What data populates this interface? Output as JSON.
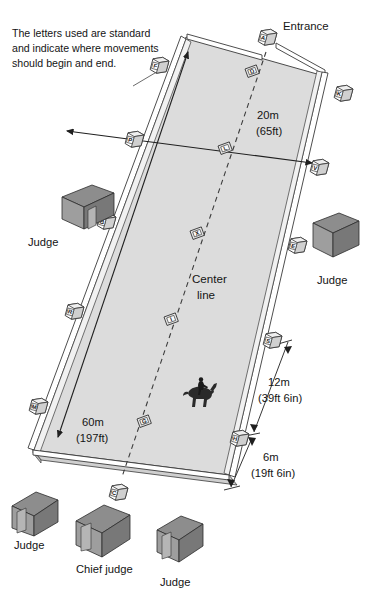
{
  "diagram": {
    "note": "The letters used are standard and indicate where movements should begin and end.",
    "entrance_label": "Entrance",
    "center_line_label_1": "Center",
    "center_line_label_2": "line",
    "dimensions": {
      "width_metric": "20m",
      "width_imperial": "(65ft)",
      "length_metric": "60m",
      "length_imperial": "(197ft)",
      "offset_long_metric": "12m",
      "offset_long_imperial": "(39ft 6in)",
      "offset_short_metric": "6m",
      "offset_short_imperial": "(19ft 6in)"
    },
    "colors": {
      "arena_fill": "#dcdcdc",
      "arena_fill_shadow": "#d2d2d2",
      "rail_fill": "#ffffff",
      "rail_stroke": "#3a3a3a",
      "marker_fill": "#fdfdfd",
      "marker_side": "#c9c9c9",
      "booth_roof": "#8a8a8a",
      "booth_front": "#9b9b9b",
      "booth_side": "#787878",
      "line_color": "#1f1f1f",
      "text_color": "#141414"
    },
    "markers": [
      {
        "id": "A",
        "letter": "A",
        "position": "short-side-entrance-top",
        "x": 268,
        "y": 33
      },
      {
        "id": "K",
        "letter": "K",
        "position": "long-side-right-1",
        "x": 345,
        "y": 91
      },
      {
        "id": "V",
        "letter": "V",
        "position": "long-side-right-2",
        "x": 321,
        "y": 165
      },
      {
        "id": "E",
        "letter": "E",
        "position": "long-side-right-3",
        "x": 299,
        "y": 243
      },
      {
        "id": "S",
        "letter": "S",
        "position": "long-side-right-4",
        "x": 274,
        "y": 338
      },
      {
        "id": "H",
        "letter": "H",
        "position": "long-side-right-5",
        "x": 241,
        "y": 436
      },
      {
        "id": "C",
        "letter": "C",
        "position": "short-side-bottom",
        "x": 120,
        "y": 490
      },
      {
        "id": "M",
        "letter": "M",
        "position": "long-side-left-5",
        "x": 40,
        "y": 404
      },
      {
        "id": "R",
        "letter": "R",
        "position": "long-side-left-4",
        "x": 76,
        "y": 309
      },
      {
        "id": "B",
        "letter": "B",
        "position": "long-side-left-3",
        "x": 108,
        "y": 219
      },
      {
        "id": "P",
        "letter": "P",
        "position": "long-side-left-2",
        "x": 136,
        "y": 137
      },
      {
        "id": "F",
        "letter": "F",
        "position": "long-side-left-1",
        "x": 161,
        "y": 63
      },
      {
        "id": "D",
        "letter": "D",
        "position": "center-line-1",
        "x": 251,
        "y": 75
      },
      {
        "id": "L",
        "letter": "L",
        "position": "center-line-2",
        "x": 224,
        "y": 152
      },
      {
        "id": "X",
        "letter": "X",
        "position": "center-line-middle",
        "x": 196,
        "y": 237
      },
      {
        "id": "I",
        "letter": "I",
        "position": "center-line-4",
        "x": 170,
        "y": 323
      },
      {
        "id": "G",
        "letter": "G",
        "position": "center-line-5",
        "x": 143,
        "y": 425
      }
    ],
    "booths": [
      {
        "id": "judge-left",
        "label": "Judge",
        "x": 62,
        "y": 185
      },
      {
        "id": "judge-right",
        "label": "Judge",
        "x": 315,
        "y": 215
      },
      {
        "id": "judge-bot-1",
        "label": "Judge",
        "x": 14,
        "y": 492
      },
      {
        "id": "chief-judge",
        "label": "Chief judge",
        "x": 78,
        "y": 505
      },
      {
        "id": "judge-bot-3",
        "label": "Judge",
        "x": 158,
        "y": 516
      }
    ],
    "rider": {
      "id": "horse-and-rider",
      "x": 183,
      "y": 392
    }
  }
}
